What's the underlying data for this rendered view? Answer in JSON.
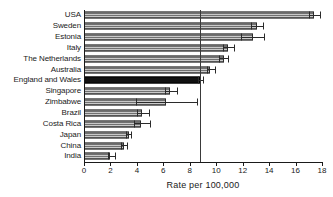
{
  "chart_data": {
    "type": "bar",
    "orientation": "horizontal",
    "title": "",
    "xlabel": "Rate per 100,000",
    "ylabel": "",
    "xlim": [
      0,
      18
    ],
    "xticks": [
      0,
      2,
      4,
      6,
      8,
      10,
      12,
      14,
      16,
      18
    ],
    "xtick_labels": [
      "0",
      "2",
      "4",
      "6",
      "8",
      "10",
      "12",
      "14",
      "16",
      "18"
    ],
    "grid": false,
    "legend": "none",
    "reference_line": {
      "value": 8.8,
      "orientation": "vertical"
    },
    "highlight_category": "England and Wales",
    "categories": [
      "USA",
      "Sweden",
      "Estonia",
      "Italy",
      "The Netherlands",
      "Australia",
      "England and Wales",
      "Singapore",
      "Zimbabwe",
      "Brazil",
      "Costa Rica",
      "Japan",
      "China",
      "India"
    ],
    "values": [
      17.4,
      13.1,
      12.8,
      10.9,
      10.6,
      9.5,
      8.8,
      6.5,
      6.2,
      4.4,
      4.3,
      3.4,
      3.0,
      2.0
    ],
    "ci_low": [
      17.0,
      12.6,
      11.9,
      10.5,
      10.2,
      9.3,
      8.6,
      6.1,
      3.9,
      4.0,
      3.8,
      3.2,
      2.8,
      1.8
    ],
    "ci_high": [
      17.9,
      13.6,
      13.7,
      11.4,
      11.0,
      10.0,
      9.1,
      7.1,
      8.6,
      5.0,
      5.1,
      3.6,
      3.3,
      2.4
    ]
  }
}
